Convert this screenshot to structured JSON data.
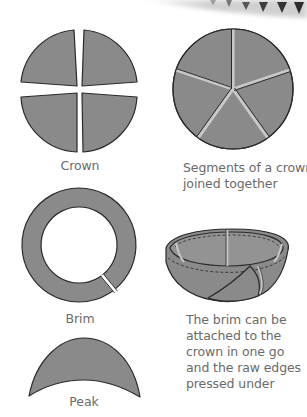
{
  "diagram": {
    "colors": {
      "fill": "#8a8a8a",
      "outline": "#2a2a2a",
      "seam": "#c8c8c8",
      "text": "#6a6a6a"
    },
    "panels": [
      {
        "id": "crown",
        "caption": "Crown",
        "shape": "circle split into four quarter segments with gaps"
      },
      {
        "id": "crown-joined",
        "caption_lines": [
          "Segments of a crown",
          "joined together"
        ],
        "shape": "circle of five wedge segments joined with seams"
      },
      {
        "id": "brim",
        "caption": "Brim",
        "shape": "ring with a single cut"
      },
      {
        "id": "brim-attached",
        "caption_lines": [
          "The brim can be",
          "attached to the",
          "crown in one go",
          "and the raw edges",
          "pressed under"
        ],
        "shape": "bowl-shaped crown with attached brim and dashed stitch lines"
      },
      {
        "id": "peak",
        "caption": "Peak",
        "shape": "crescent-shaped peak"
      }
    ],
    "decoration": {
      "description": "faded decorative border of arrow/triangle motifs at top right"
    }
  }
}
